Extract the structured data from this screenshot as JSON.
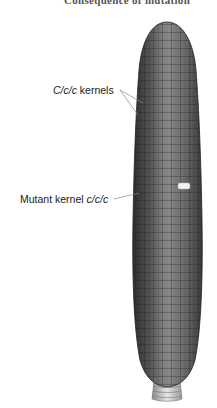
{
  "figure": {
    "title_partial": "Consequence of mutation",
    "labels": {
      "normal": {
        "genotype": "C/c/c",
        "suffix": " kernels"
      },
      "mutant": {
        "prefix": "Mutant kernel ",
        "genotype": "c/c/c"
      }
    },
    "colors": {
      "kernel_dark": "#3a3a3a",
      "kernel_mid": "#6e6e6e",
      "kernel_light": "#9a9a9a",
      "mutant_kernel": "#f2f2f2",
      "leader_line": "#888888",
      "shank": "#c8c8c8"
    }
  }
}
